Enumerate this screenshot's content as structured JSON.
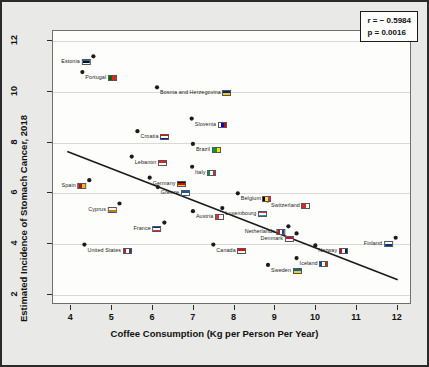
{
  "chart_data": {
    "type": "scatter",
    "title": "",
    "xlabel": "Coffee Consumption (Kg per Person Per Year)",
    "ylabel": "Estimated Incidence of Stomach Cancer, 2018",
    "xlim": [
      3.55,
      12.35
    ],
    "ylim": [
      1.6,
      12.4
    ],
    "xticks": [
      4,
      5,
      6,
      7,
      8,
      9,
      10,
      11,
      12
    ],
    "yticks": [
      2,
      4,
      6,
      8,
      10,
      12
    ],
    "grid": true,
    "legend": "none",
    "annotations": {
      "r_label": "r = − 0.5984",
      "p_label": "p = 0.0016"
    },
    "trendline": {
      "type": "linear",
      "x_start": 3.9,
      "y_start": 7.65,
      "x_end": 12.0,
      "y_end": 2.6
    },
    "point_labels_note": "each point annotated with country name and national flag glyph",
    "points": [
      {
        "label": "Estonia",
        "x": 4.54,
        "y": 11.4,
        "side": "right",
        "flag": [
          "#0072ce",
          "#111111",
          "#ffffff"
        ]
      },
      {
        "label": "Portugal",
        "x": 4.27,
        "y": 10.78,
        "side": "left",
        "flag": [
          "#006600",
          "#da291c"
        ]
      },
      {
        "label": "Bosnia and Herzegovina",
        "x": 6.1,
        "y": 10.18,
        "side": "left",
        "flag": [
          "#002395",
          "#fecb00"
        ]
      },
      {
        "label": "Slovenia",
        "x": 6.95,
        "y": 8.95,
        "side": "left",
        "flag": [
          "#ffffff",
          "#0000c8",
          "#d50000"
        ]
      },
      {
        "label": "Croatia",
        "x": 5.62,
        "y": 8.45,
        "side": "left",
        "flag": [
          "#ff0000",
          "#ffffff",
          "#171796"
        ]
      },
      {
        "label": "Brazil",
        "x": 6.98,
        "y": 7.95,
        "side": "left",
        "flag": [
          "#009b3a",
          "#fedf00"
        ]
      },
      {
        "label": "Lebanon",
        "x": 5.48,
        "y": 7.45,
        "side": "left",
        "flag": [
          "#ed1c24",
          "#ffffff"
        ]
      },
      {
        "label": "Italy",
        "x": 6.96,
        "y": 7.05,
        "side": "left",
        "flag": [
          "#009246",
          "#ffffff",
          "#ce2b37"
        ]
      },
      {
        "label": "Germany",
        "x": 5.92,
        "y": 6.62,
        "side": "left",
        "flag": [
          "#000000",
          "#dd0000",
          "#ffce00"
        ]
      },
      {
        "label": "Spain",
        "x": 4.44,
        "y": 6.52,
        "side": "right",
        "flag": [
          "#aa151b",
          "#f1bf00"
        ]
      },
      {
        "label": "Greece",
        "x": 6.12,
        "y": 6.25,
        "side": "left",
        "flag": [
          "#0d5eaf",
          "#ffffff"
        ]
      },
      {
        "label": "Belgium",
        "x": 8.08,
        "y": 6.0,
        "side": "left",
        "flag": [
          "#000000",
          "#fae042",
          "#ed2939"
        ]
      },
      {
        "label": "Cyprus",
        "x": 5.18,
        "y": 5.6,
        "side": "right",
        "flag": [
          "#ffffff",
          "#d57800"
        ]
      },
      {
        "label": "Austria",
        "x": 6.98,
        "y": 5.3,
        "side": "left",
        "flag": [
          "#ed2939",
          "#ffffff"
        ]
      },
      {
        "label": "Luxembourg",
        "x": 7.7,
        "y": 5.42,
        "side": "left",
        "flag": [
          "#ed2939",
          "#ffffff",
          "#00a1de"
        ]
      },
      {
        "label": "Switzerland",
        "x": 8.82,
        "y": 5.72,
        "side": "left",
        "flag": [
          "#d52b1e",
          "#ffffff"
        ]
      },
      {
        "label": "France",
        "x": 6.28,
        "y": 4.85,
        "side": "right",
        "flag": [
          "#002395",
          "#ffffff",
          "#ed2939"
        ]
      },
      {
        "label": "Netherlands",
        "x": 9.32,
        "y": 4.7,
        "side": "right",
        "flag": [
          "#ae1c28",
          "#ffffff",
          "#21468b"
        ]
      },
      {
        "label": "Denmark",
        "x": 9.52,
        "y": 4.42,
        "side": "right",
        "flag": [
          "#c60c30",
          "#ffffff"
        ]
      },
      {
        "label": "United States",
        "x": 4.32,
        "y": 3.98,
        "side": "left",
        "flag": [
          "#b22234",
          "#ffffff",
          "#3c3b6e"
        ]
      },
      {
        "label": "Canada",
        "x": 7.48,
        "y": 3.98,
        "side": "left",
        "flag": [
          "#ff0000",
          "#ffffff"
        ]
      },
      {
        "label": "Norway",
        "x": 9.98,
        "y": 3.95,
        "side": "left",
        "flag": [
          "#ba0c2f",
          "#ffffff",
          "#00205b"
        ]
      },
      {
        "label": "Finland",
        "x": 11.95,
        "y": 4.25,
        "side": "right",
        "flag": [
          "#ffffff",
          "#003580"
        ]
      },
      {
        "label": "Iceland",
        "x": 9.52,
        "y": 3.45,
        "side": "left",
        "flag": [
          "#02529c",
          "#ffffff",
          "#dc1e35"
        ]
      },
      {
        "label": "Sweden",
        "x": 8.82,
        "y": 3.18,
        "side": "left",
        "flag": [
          "#006aa7",
          "#fecc00"
        ]
      }
    ]
  }
}
